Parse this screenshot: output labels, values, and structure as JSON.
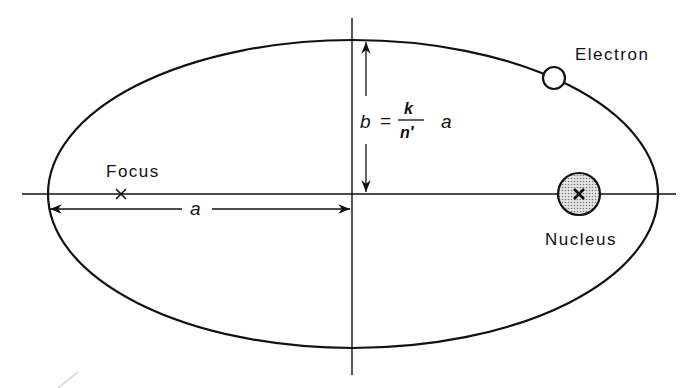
{
  "diagram": {
    "labels": {
      "electron": "Electron",
      "nucleus": "Nucleus",
      "focus": "Focus",
      "semi_major": "a",
      "formula_lhs": "b",
      "formula_eq": "=",
      "formula_num": "k",
      "formula_den": "n′",
      "formula_rhs": "a"
    },
    "geometry": {
      "ellipse_center": [
        353,
        194
      ],
      "rx": 305,
      "ry": 154,
      "focus_x": 121,
      "nucleus_x": 579,
      "electron_pos": [
        554,
        47
      ]
    },
    "colors": {
      "stroke": "#111111",
      "nucleus_fill": "#bdbdbd",
      "background": "#ffffff"
    }
  }
}
